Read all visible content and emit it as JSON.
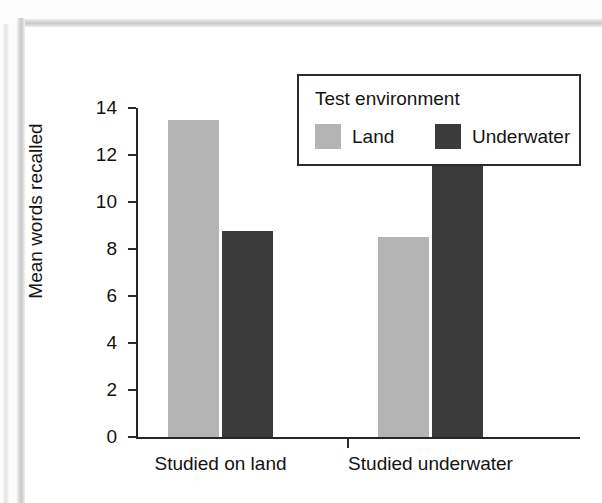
{
  "page": {
    "kind": "scanned-textbook-figure",
    "background_color": "#ffffff"
  },
  "chart_data": {
    "type": "bar",
    "title": "",
    "subtitle": "",
    "xlabel": "",
    "ylabel": "Mean words recalled",
    "categories": [
      "Studied on land",
      "Studied underwater"
    ],
    "series": [
      {
        "name": "Land",
        "color": "#b4b4b4",
        "values": [
          13.5,
          8.5
        ]
      },
      {
        "name": "Underwater",
        "color": "#3b3b3b",
        "values": [
          8.75,
          11.6
        ]
      }
    ],
    "ylim": [
      0,
      14
    ],
    "ytick_values": [
      0,
      2,
      4,
      6,
      8,
      10,
      12,
      14
    ],
    "ytick_labels": [
      "0",
      "2",
      "4",
      "6",
      "8",
      "10",
      "12",
      "14"
    ],
    "grid": false,
    "legend_position": "upper-right-inside",
    "legend_title": "Test environment",
    "legend_entries": [
      {
        "label": "Land",
        "color": "#b4b4b4"
      },
      {
        "label": "Underwater",
        "color": "#3b3b3b"
      }
    ],
    "annotations": []
  },
  "axes": {
    "y_title": "Mean words recalled",
    "x_categories": [
      "Studied on land",
      "Studied underwater"
    ]
  },
  "legend": {
    "title": "Test environment",
    "items": [
      {
        "label": "Land"
      },
      {
        "label": "Underwater"
      }
    ]
  },
  "colors": {
    "land": "#b4b4b4",
    "underwater": "#3b3b3b",
    "axis": "#262626",
    "text": "#131313"
  }
}
